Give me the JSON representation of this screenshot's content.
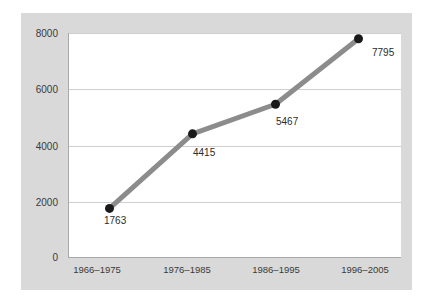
{
  "chart_data": {
    "type": "line",
    "title": "",
    "subtitle": "",
    "xlabel": "",
    "ylabel": "",
    "categories": [
      "1966–1975",
      "1976–1985",
      "1986–1995",
      "1996–2005"
    ],
    "values": [
      1763,
      4415,
      5467,
      7795
    ],
    "point_labels": [
      "1763",
      "4415",
      "5467",
      "7795"
    ],
    "series": [
      {
        "name": "",
        "values": [
          1763,
          4415,
          5467,
          7795
        ]
      }
    ],
    "ylim": [
      0,
      8000
    ],
    "yticks": [
      0,
      2000,
      4000,
      6000,
      8000
    ],
    "ytick_labels": [
      "0",
      "2000",
      "4000",
      "6000",
      "8000"
    ],
    "grid": true,
    "grid_axis": "y",
    "legend": false,
    "legend_position": "none",
    "marker": "circle",
    "colors": {
      "line": "#8c8c8c",
      "marker": "#1a1a1a",
      "gridline": "#cfcfcf",
      "axis": "#a8a8a8",
      "panel_background": "#d9d9d9",
      "plot_background": "#ffffff",
      "figure_background": "#ffffff",
      "text": "#3a3a3a"
    }
  }
}
